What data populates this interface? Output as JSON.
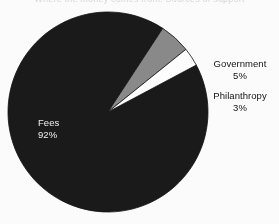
{
  "figure": {
    "title_remnant": "Where the money comes from: Sources of support",
    "background_color": "#fdfdfd"
  },
  "labels": {
    "government": {
      "name": "Government",
      "percent": "5%"
    },
    "philanthropy": {
      "name": "Philanthropy",
      "percent": "3%"
    },
    "fees": {
      "name": "Fees",
      "percent": "92%"
    }
  },
  "chart_data": {
    "type": "pie",
    "title": "",
    "categories": [
      "Fees",
      "Government",
      "Philanthropy"
    ],
    "values": [
      92,
      5,
      3
    ],
    "value_labels": [
      "92%",
      "5%",
      "3%"
    ],
    "unit": "percent",
    "total": 100,
    "colors": [
      "#1a1a1a",
      "#8a8a8a",
      "#ffffff"
    ],
    "edge_color": "#111111",
    "legend": "none",
    "label_placement": [
      "inside",
      "outside-right",
      "outside-right"
    ],
    "start_angle_deg": -28,
    "direction": "clockwise",
    "center_px": [
      108,
      112
    ],
    "radius_px": 100,
    "slices": [
      {
        "name": "Fees",
        "percent": 92,
        "color": "#1a1a1a",
        "label_text": "Fees",
        "value_text": "92%",
        "text_color": "#f2f2f2"
      },
      {
        "name": "Government",
        "percent": 5,
        "color": "#8a8a8a",
        "label_text": "Government",
        "value_text": "5%",
        "text_color": "#141414"
      },
      {
        "name": "Philanthropy",
        "percent": 3,
        "color": "#ffffff",
        "label_text": "Philanthropy",
        "value_text": "3%",
        "text_color": "#141414"
      }
    ]
  }
}
